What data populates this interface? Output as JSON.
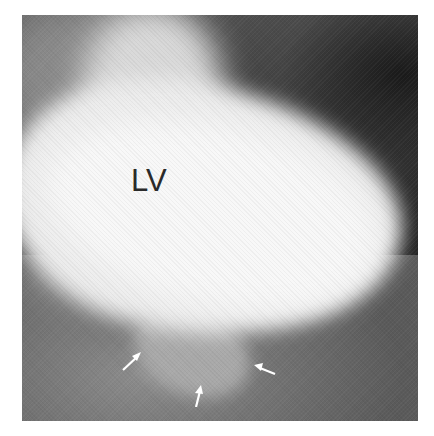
{
  "figure": {
    "type": "left ventriculogram (angiographic image)",
    "colors": {
      "background": "#ffffff",
      "ventricle": "#eeeeee",
      "surroundings_dark": "#1c1c1c",
      "surroundings_mid": "#6e6e6e",
      "label_text": "#2a2a2a",
      "arrow": "#ffffff"
    },
    "labels": [
      {
        "text": "LV",
        "meaning": "left ventricle"
      }
    ],
    "annotations": {
      "arrows": [
        {
          "id": "arrow-left",
          "points": "up-right",
          "color": "white"
        },
        {
          "id": "arrow-bottom",
          "points": "up",
          "color": "white"
        },
        {
          "id": "arrow-right",
          "points": "left",
          "color": "white"
        }
      ],
      "arrow_target": "outpouching below the ventricle"
    }
  }
}
